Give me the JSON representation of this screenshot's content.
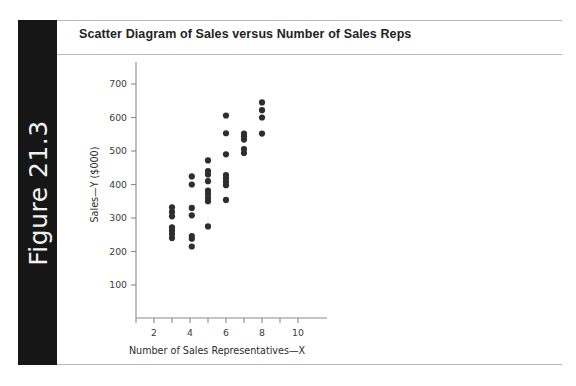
{
  "figure": {
    "label": "Figure 21.3"
  },
  "title": "Scatter Diagram of Sales versus Number of Sales Reps",
  "colors": {
    "bar_background": "#161616",
    "bar_text": "#f2f2f2",
    "title_text": "#232323",
    "rule": "#b9b9b9",
    "axis": "#8a8a8a",
    "marker": "#2e2e2e",
    "page_background": "#ffffff"
  },
  "chart_data": {
    "type": "scatter",
    "title": "Scatter Diagram of Sales versus Number of Sales Reps",
    "xlabel": "Number of Sales Representatives—X",
    "ylabel": "Sales—Y ($000)",
    "xlim": [
      0,
      10.6
    ],
    "ylim": [
      0,
      760
    ],
    "grid": false,
    "legend": null,
    "x_ticks": [
      1,
      2,
      3,
      4,
      5,
      6,
      7,
      8,
      9,
      10
    ],
    "x_tick_labels": [
      "",
      "2",
      "",
      "4",
      "",
      "6",
      "",
      "8",
      "",
      "10"
    ],
    "y_ticks": [
      100,
      200,
      300,
      400,
      500,
      600,
      700
    ],
    "y_tick_labels": [
      "100",
      "200",
      "300",
      "400",
      "500",
      "600",
      "700"
    ],
    "points": [
      {
        "x": 3.0,
        "y": 240
      },
      {
        "x": 3.0,
        "y": 252
      },
      {
        "x": 3.0,
        "y": 262
      },
      {
        "x": 3.0,
        "y": 272
      },
      {
        "x": 3.0,
        "y": 305
      },
      {
        "x": 3.0,
        "y": 318
      },
      {
        "x": 3.0,
        "y": 332
      },
      {
        "x": 4.1,
        "y": 215
      },
      {
        "x": 4.1,
        "y": 238
      },
      {
        "x": 4.1,
        "y": 246
      },
      {
        "x": 4.1,
        "y": 308
      },
      {
        "x": 4.1,
        "y": 330
      },
      {
        "x": 4.1,
        "y": 400
      },
      {
        "x": 4.1,
        "y": 424
      },
      {
        "x": 5.0,
        "y": 275
      },
      {
        "x": 5.0,
        "y": 350
      },
      {
        "x": 5.0,
        "y": 360
      },
      {
        "x": 5.0,
        "y": 372
      },
      {
        "x": 5.0,
        "y": 382
      },
      {
        "x": 5.0,
        "y": 410
      },
      {
        "x": 5.0,
        "y": 430
      },
      {
        "x": 5.0,
        "y": 440
      },
      {
        "x": 5.0,
        "y": 472
      },
      {
        "x": 6.0,
        "y": 354
      },
      {
        "x": 6.0,
        "y": 398
      },
      {
        "x": 6.0,
        "y": 408
      },
      {
        "x": 6.0,
        "y": 418
      },
      {
        "x": 6.0,
        "y": 428
      },
      {
        "x": 6.0,
        "y": 490
      },
      {
        "x": 6.0,
        "y": 553
      },
      {
        "x": 6.0,
        "y": 606
      },
      {
        "x": 7.0,
        "y": 494
      },
      {
        "x": 7.0,
        "y": 506
      },
      {
        "x": 7.0,
        "y": 534
      },
      {
        "x": 7.0,
        "y": 544
      },
      {
        "x": 7.0,
        "y": 552
      },
      {
        "x": 8.0,
        "y": 552
      },
      {
        "x": 8.0,
        "y": 600
      },
      {
        "x": 8.0,
        "y": 622
      },
      {
        "x": 8.0,
        "y": 645
      }
    ]
  }
}
